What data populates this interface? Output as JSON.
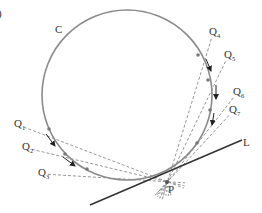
{
  "figure": {
    "panel_label": ")",
    "circle_label": "C",
    "tangent_label": "L",
    "point_label": "P",
    "colors": {
      "circle": "#8a8a8a",
      "tangent": "#333333",
      "secant": "#8a8a8a",
      "arrow": "#222222",
      "text": "#333333"
    },
    "secants": [
      {
        "label": "Q",
        "sub": "1"
      },
      {
        "label": "Q",
        "sub": "2"
      },
      {
        "label": "Q",
        "sub": "3"
      },
      {
        "label": "Q",
        "sub": "4"
      },
      {
        "label": "Q",
        "sub": "5"
      },
      {
        "label": "Q",
        "sub": "6"
      },
      {
        "label": "Q",
        "sub": "7"
      }
    ]
  }
}
